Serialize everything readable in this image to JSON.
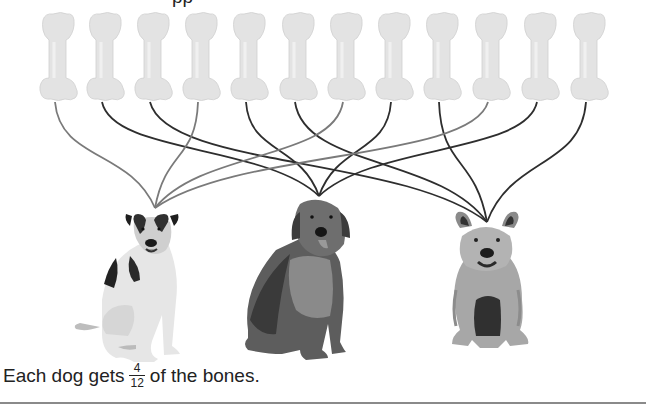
{
  "top_text_fragment": "pp",
  "caption": {
    "before": "Each dog gets",
    "fraction": {
      "numerator": "4",
      "denominator": "12"
    },
    "after": "of the bones."
  },
  "colors": {
    "bone": "#e3e3e3",
    "bone_shade": "#cfcfcf",
    "line_gray": "#7a7a7a",
    "line_dark": "#2e2e2e",
    "rule": "#8a8a8a"
  },
  "bones": [
    {
      "id": 1,
      "x": 57,
      "dog": 1
    },
    {
      "id": 2,
      "x": 104,
      "dog": 2
    },
    {
      "id": 3,
      "x": 152,
      "dog": 3
    },
    {
      "id": 4,
      "x": 200,
      "dog": 1
    },
    {
      "id": 5,
      "x": 248,
      "dog": 2
    },
    {
      "id": 6,
      "x": 297,
      "dog": 3
    },
    {
      "id": 7,
      "x": 345,
      "dog": 1
    },
    {
      "id": 8,
      "x": 393,
      "dog": 2
    },
    {
      "id": 9,
      "x": 441,
      "dog": 3
    },
    {
      "id": 10,
      "x": 490,
      "dog": 1
    },
    {
      "id": 11,
      "x": 539,
      "dog": 2
    },
    {
      "id": 12,
      "x": 588,
      "dog": 3
    }
  ],
  "dogs": [
    {
      "id": 1,
      "name": "jack-russell-terrier",
      "anchor_x": 155,
      "anchor_y": 208,
      "line": "gray"
    },
    {
      "id": 2,
      "name": "golden-retriever",
      "anchor_x": 319,
      "anchor_y": 196,
      "line": "dark"
    },
    {
      "id": 3,
      "name": "shaggy-terrier",
      "anchor_x": 487,
      "anchor_y": 222,
      "line": "dark"
    }
  ]
}
